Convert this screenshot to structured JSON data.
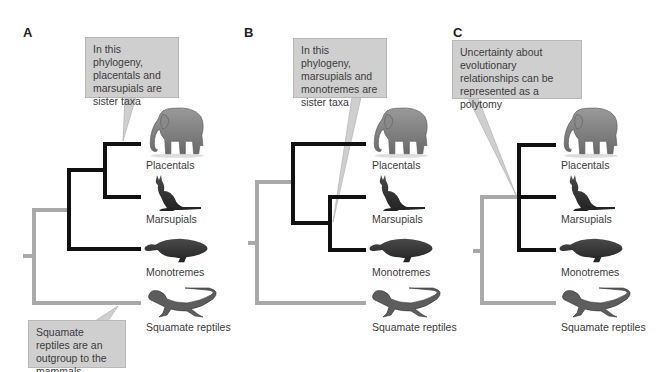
{
  "colors": {
    "ingroup_branch": "#111111",
    "outgroup_branch": "#a9a9a9",
    "callout_fill": "#cfcfcf",
    "callout_border": "#b8b8b8",
    "text": "#3c3c3c"
  },
  "taxa": [
    "Placentals",
    "Marsupials",
    "Monotremes",
    "Squamate reptiles"
  ],
  "panels": [
    {
      "letter": "A",
      "callout": "In this phylogeny, placentals and marsupials are sister taxa",
      "outgroup_callout": "Squamate reptiles are an outgroup to the mammals",
      "labels": [
        "Placentals",
        "Marsupials",
        "Monotremes",
        "Squamate reptiles"
      ]
    },
    {
      "letter": "B",
      "callout": "In this phylogeny, marsupials and monotremes are sister taxa",
      "labels": [
        "Placentals",
        "Marsupials",
        "Monotremes",
        "Squamate reptiles"
      ]
    },
    {
      "letter": "C",
      "callout": "Uncertainty about evolutionary relationships can be represented as a polytomy",
      "labels": [
        "Placentals",
        "Marsupials",
        "Monotremes",
        "Squamate reptiles"
      ]
    }
  ],
  "icons": {
    "placentals": "elephant-icon",
    "marsupials": "kangaroo-icon",
    "monotremes": "platypus-icon",
    "squamates": "lizard-icon"
  }
}
